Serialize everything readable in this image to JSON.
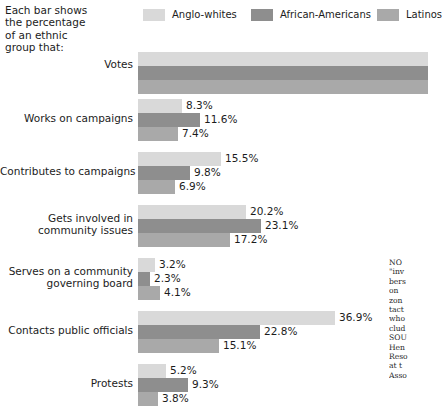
{
  "intro": {
    "name": "chart-intro-caption",
    "lines": [
      "Each bar shows",
      "the percentage",
      "of an ethnic",
      "group that:"
    ]
  },
  "legend": {
    "items": [
      {
        "label": "Anglo-whites",
        "color": "#d9d9d9"
      },
      {
        "label": "African-Americans",
        "color": "#8e8e8e"
      },
      {
        "label": "Latinos",
        "color": "#a9a9a9"
      }
    ]
  },
  "note": {
    "lines": [
      "NO",
      "\"inv",
      "bers",
      "on ",
      "zon",
      "tact",
      "who",
      "clud",
      "SOU",
      "Hen",
      "Reso",
      "at t",
      "Asso"
    ]
  },
  "chart_data": {
    "type": "bar",
    "orientation": "horizontal",
    "title": "",
    "subtitle": "Each bar shows the percentage of an ethnic group that:",
    "xlabel": "",
    "ylabel": "",
    "grid": false,
    "legend_position": "top",
    "value_suffix": "%",
    "px_per_percent": 5.34,
    "xlim": [
      0,
      52
    ],
    "series": [
      {
        "name": "Anglo-whites",
        "color": "#d9d9d9",
        "values": [
          null,
          8.3,
          15.5,
          20.2,
          3.2,
          36.9,
          5.2
        ]
      },
      {
        "name": "African-Americans",
        "color": "#8e8e8e",
        "values": [
          null,
          11.6,
          9.8,
          23.1,
          2.3,
          22.8,
          9.3
        ]
      },
      {
        "name": "Latinos",
        "color": "#a9a9a9",
        "values": [
          null,
          7.4,
          6.9,
          17.2,
          4.1,
          15.1,
          3.8
        ]
      }
    ],
    "categories": [
      "Votes",
      "Works on campaigns",
      "Contributes to campaigns",
      "Gets involved in community issues",
      "Serves on a community governing board",
      "Contacts public officials",
      "Protests"
    ],
    "groups": [
      {
        "label_lines": [
          "Votes"
        ],
        "top": 52,
        "label_top": 58,
        "clipped": true,
        "bars": [
          {
            "series": "Anglo-whites",
            "value": null,
            "value_label": "",
            "width": 290,
            "color": "#d9d9d9"
          },
          {
            "series": "African-Americans",
            "value": null,
            "value_label": "",
            "width": 290,
            "color": "#8e8e8e"
          },
          {
            "series": "Latinos",
            "value": null,
            "value_label": "",
            "width": 290,
            "color": "#a9a9a9"
          }
        ]
      },
      {
        "label_lines": [
          "Works on campaigns"
        ],
        "top": 99,
        "label_top": 112,
        "clipped": false,
        "bars": [
          {
            "series": "Anglo-whites",
            "value": 8.3,
            "value_label": "8.3%",
            "width": 44,
            "color": "#d9d9d9"
          },
          {
            "series": "African-Americans",
            "value": 11.6,
            "value_label": "11.6%",
            "width": 62,
            "color": "#8e8e8e"
          },
          {
            "series": "Latinos",
            "value": 7.4,
            "value_label": "7.4%",
            "width": 40,
            "color": "#a9a9a9"
          }
        ]
      },
      {
        "label_lines": [
          "Contributes to campaigns"
        ],
        "top": 152,
        "label_top": 165,
        "clipped": false,
        "bars": [
          {
            "series": "Anglo-whites",
            "value": 15.5,
            "value_label": "15.5%",
            "width": 83,
            "color": "#d9d9d9"
          },
          {
            "series": "African-Americans",
            "value": 9.8,
            "value_label": "9.8%",
            "width": 52,
            "color": "#8e8e8e"
          },
          {
            "series": "Latinos",
            "value": 6.9,
            "value_label": "6.9%",
            "width": 37,
            "color": "#a9a9a9"
          }
        ]
      },
      {
        "label_lines": [
          "Gets involved in",
          "community issues"
        ],
        "top": 205,
        "label_top": 212,
        "clipped": false,
        "bars": [
          {
            "series": "Anglo-whites",
            "value": 20.2,
            "value_label": "20.2%",
            "width": 108,
            "color": "#d9d9d9"
          },
          {
            "series": "African-Americans",
            "value": 23.1,
            "value_label": "23.1%",
            "width": 123,
            "color": "#8e8e8e"
          },
          {
            "series": "Latinos",
            "value": 17.2,
            "value_label": "17.2%",
            "width": 92,
            "color": "#a9a9a9"
          }
        ]
      },
      {
        "label_lines": [
          "Serves on a community",
          "governing board"
        ],
        "top": 258,
        "label_top": 265,
        "clipped": false,
        "bars": [
          {
            "series": "Anglo-whites",
            "value": 3.2,
            "value_label": "3.2%",
            "width": 17,
            "color": "#d9d9d9"
          },
          {
            "series": "African-Americans",
            "value": 2.3,
            "value_label": "2.3%",
            "width": 12,
            "color": "#8e8e8e"
          },
          {
            "series": "Latinos",
            "value": 4.1,
            "value_label": "4.1%",
            "width": 22,
            "color": "#a9a9a9"
          }
        ]
      },
      {
        "label_lines": [
          "Contacts public officials"
        ],
        "top": 311,
        "label_top": 324,
        "clipped": false,
        "bars": [
          {
            "series": "Anglo-whites",
            "value": 36.9,
            "value_label": "36.9%",
            "width": 197,
            "color": "#d9d9d9"
          },
          {
            "series": "African-Americans",
            "value": 22.8,
            "value_label": "22.8%",
            "width": 122,
            "color": "#8e8e8e"
          },
          {
            "series": "Latinos",
            "value": 15.1,
            "value_label": "15.1%",
            "width": 81,
            "color": "#a9a9a9"
          }
        ]
      },
      {
        "label_lines": [
          "Protests"
        ],
        "top": 364,
        "label_top": 377,
        "clipped": false,
        "bars": [
          {
            "series": "Anglo-whites",
            "value": 5.2,
            "value_label": "5.2%",
            "width": 28,
            "color": "#d9d9d9"
          },
          {
            "series": "African-Americans",
            "value": 9.3,
            "value_label": "9.3%",
            "width": 50,
            "color": "#8e8e8e"
          },
          {
            "series": "Latinos",
            "value": 3.8,
            "value_label": "3.8%",
            "width": 20,
            "color": "#a9a9a9"
          }
        ]
      }
    ]
  }
}
